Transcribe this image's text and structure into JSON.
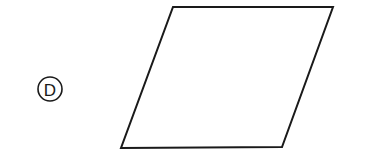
{
  "option": {
    "label": "D",
    "circle": {
      "cx": 50,
      "cy": 89,
      "r": 12
    }
  },
  "shape": {
    "type": "parallelogram",
    "points": "173,7 333,7 282,147 121,148",
    "stroke": "#1a1a1a",
    "fill": "none",
    "stroke_width": 2
  }
}
